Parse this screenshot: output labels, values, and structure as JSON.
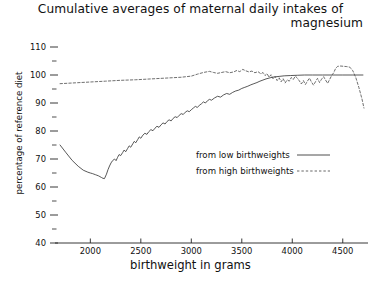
{
  "chart_data": {
    "type": "line",
    "title": "Cumulative averages of maternal daily intakes of magnesium",
    "title_line1": "Cumulative averages of maternal daily intakes of",
    "title_line2": "magnesium",
    "xlabel": "birthweight in grams",
    "ylabel": "percentage of reference diet",
    "xlim": [
      1650,
      4750
    ],
    "ylim": [
      40,
      110
    ],
    "grid": false,
    "legend_position": "center-right",
    "xticks": [
      2000,
      2500,
      3000,
      3500,
      4000,
      4500
    ],
    "xtick_labels": [
      "2000",
      "2500",
      "3000",
      "3500",
      "4000",
      "4500"
    ],
    "yticks": [
      40,
      50,
      60,
      70,
      80,
      90,
      100,
      110
    ],
    "ytick_labels": [
      "40",
      "50",
      "60",
      "70",
      "80",
      "90",
      "100",
      "110"
    ],
    "yminorticks": [
      45,
      55,
      65,
      75,
      85,
      95,
      105
    ],
    "series": [
      {
        "name": "from low birthweights",
        "style": "solid",
        "color": "#3a3a3a",
        "x": [
          1700,
          1760,
          1820,
          1880,
          1930,
          1975,
          2000,
          2020,
          2035,
          2050,
          2065,
          2080,
          2095,
          2110,
          2125,
          2140,
          2160,
          2175,
          2190,
          2205,
          2220,
          2240,
          2255,
          2270,
          2285,
          2300,
          2320,
          2335,
          2350,
          2370,
          2385,
          2400,
          2420,
          2435,
          2450,
          2470,
          2485,
          2500,
          2520,
          2540,
          2560,
          2580,
          2600,
          2620,
          2640,
          2660,
          2680,
          2700,
          2720,
          2740,
          2760,
          2780,
          2800,
          2820,
          2840,
          2860,
          2880,
          2900,
          2920,
          2940,
          2960,
          2980,
          3000,
          3020,
          3040,
          3060,
          3080,
          3100,
          3120,
          3140,
          3160,
          3180,
          3200,
          3230,
          3260,
          3290,
          3320,
          3350,
          3380,
          3410,
          3440,
          3470,
          3500,
          3530,
          3560,
          3590,
          3620,
          3650,
          3680,
          3710,
          3740,
          3780,
          3820,
          3870,
          3920,
          3980,
          4050,
          4120,
          4200,
          4300,
          4400,
          4500,
          4600,
          4700
        ],
        "y": [
          75.0,
          72.2,
          69.5,
          67.4,
          66.0,
          65.3,
          65.0,
          64.8,
          64.6,
          64.4,
          64.2,
          64.0,
          63.7,
          63.4,
          63.1,
          63.0,
          64.6,
          66.2,
          67.5,
          68.6,
          69.4,
          70.0,
          69.4,
          70.6,
          71.6,
          71.2,
          72.3,
          73.2,
          72.6,
          73.8,
          74.7,
          74.2,
          75.4,
          76.3,
          75.8,
          77.0,
          77.9,
          77.4,
          78.5,
          79.2,
          78.8,
          79.8,
          80.5,
          80.1,
          81.0,
          81.7,
          81.3,
          82.2,
          82.9,
          82.5,
          83.4,
          84.0,
          83.6,
          84.5,
          85.1,
          84.8,
          85.6,
          86.2,
          85.9,
          86.7,
          87.2,
          86.9,
          87.6,
          88.2,
          88.8,
          88.4,
          89.2,
          89.7,
          90.4,
          90.0,
          90.8,
          91.3,
          91.0,
          91.8,
          92.4,
          92.1,
          92.9,
          93.4,
          93.1,
          93.8,
          94.3,
          94.6,
          95.2,
          95.6,
          96.0,
          96.5,
          96.9,
          97.3,
          97.8,
          98.2,
          98.6,
          99.0,
          99.3,
          99.5,
          99.7,
          99.8,
          99.9,
          100.0,
          100.0,
          100.0,
          100.0,
          100.0,
          100.0,
          100.0
        ]
      },
      {
        "name": "from high birthweights",
        "style": "dashed",
        "color": "#555555",
        "x": [
          1700,
          1850,
          2000,
          2150,
          2300,
          2450,
          2600,
          2750,
          2900,
          3000,
          3060,
          3120,
          3180,
          3220,
          3260,
          3300,
          3340,
          3380,
          3420,
          3450,
          3480,
          3510,
          3540,
          3570,
          3600,
          3630,
          3660,
          3690,
          3710,
          3730,
          3750,
          3770,
          3790,
          3810,
          3830,
          3850,
          3870,
          3890,
          3910,
          3930,
          3950,
          3970,
          3990,
          4010,
          4030,
          4050,
          4070,
          4090,
          4110,
          4130,
          4150,
          4170,
          4190,
          4210,
          4230,
          4250,
          4270,
          4290,
          4310,
          4330,
          4350,
          4370,
          4390,
          4410,
          4430,
          4450,
          4480,
          4510,
          4540,
          4570,
          4600,
          4630,
          4660,
          4690,
          4710
        ],
        "y": [
          96.9,
          97.2,
          97.5,
          97.8,
          98.1,
          98.3,
          98.6,
          98.9,
          99.2,
          99.6,
          100.3,
          100.9,
          101.3,
          100.9,
          100.6,
          100.9,
          101.2,
          100.8,
          101.1,
          101.6,
          101.2,
          102.0,
          101.5,
          101.1,
          101.4,
          100.8,
          101.2,
          100.4,
          100.9,
          99.8,
          100.5,
          99.2,
          100.1,
          98.6,
          99.5,
          98.0,
          99.0,
          97.6,
          98.7,
          97.2,
          98.3,
          97.8,
          99.1,
          98.4,
          99.6,
          98.9,
          97.9,
          96.8,
          98.0,
          96.6,
          97.8,
          98.9,
          97.5,
          96.4,
          97.6,
          98.8,
          97.3,
          98.5,
          99.4,
          98.2,
          97.0,
          98.4,
          99.8,
          100.8,
          102.4,
          103.1,
          103.2,
          103.1,
          103.0,
          102.8,
          101.5,
          99.0,
          95.5,
          91.5,
          88.2
        ]
      }
    ],
    "legend": [
      {
        "label": "from low birthweights",
        "style": "solid"
      },
      {
        "label": "from high birthweights",
        "style": "dashed"
      }
    ]
  }
}
